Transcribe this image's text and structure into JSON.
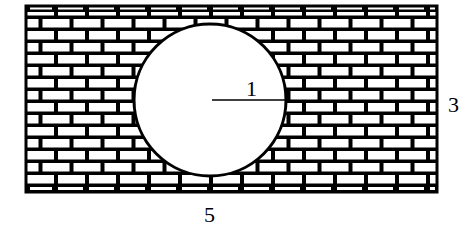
{
  "diagram": {
    "rectangle": {
      "x": 25,
      "y": 5,
      "width": 413,
      "height": 188,
      "width_label": "5",
      "height_label": "3"
    },
    "circle": {
      "cx": 210,
      "cy": 100,
      "r": 76,
      "radius_label": "1"
    },
    "labels": {
      "radius": "1",
      "height": "3",
      "width": "5"
    },
    "colors": {
      "line": "#000000",
      "fill": "#ffffff"
    },
    "pattern": {
      "type": "brick",
      "brick_width": 31,
      "brick_height": 12
    }
  }
}
